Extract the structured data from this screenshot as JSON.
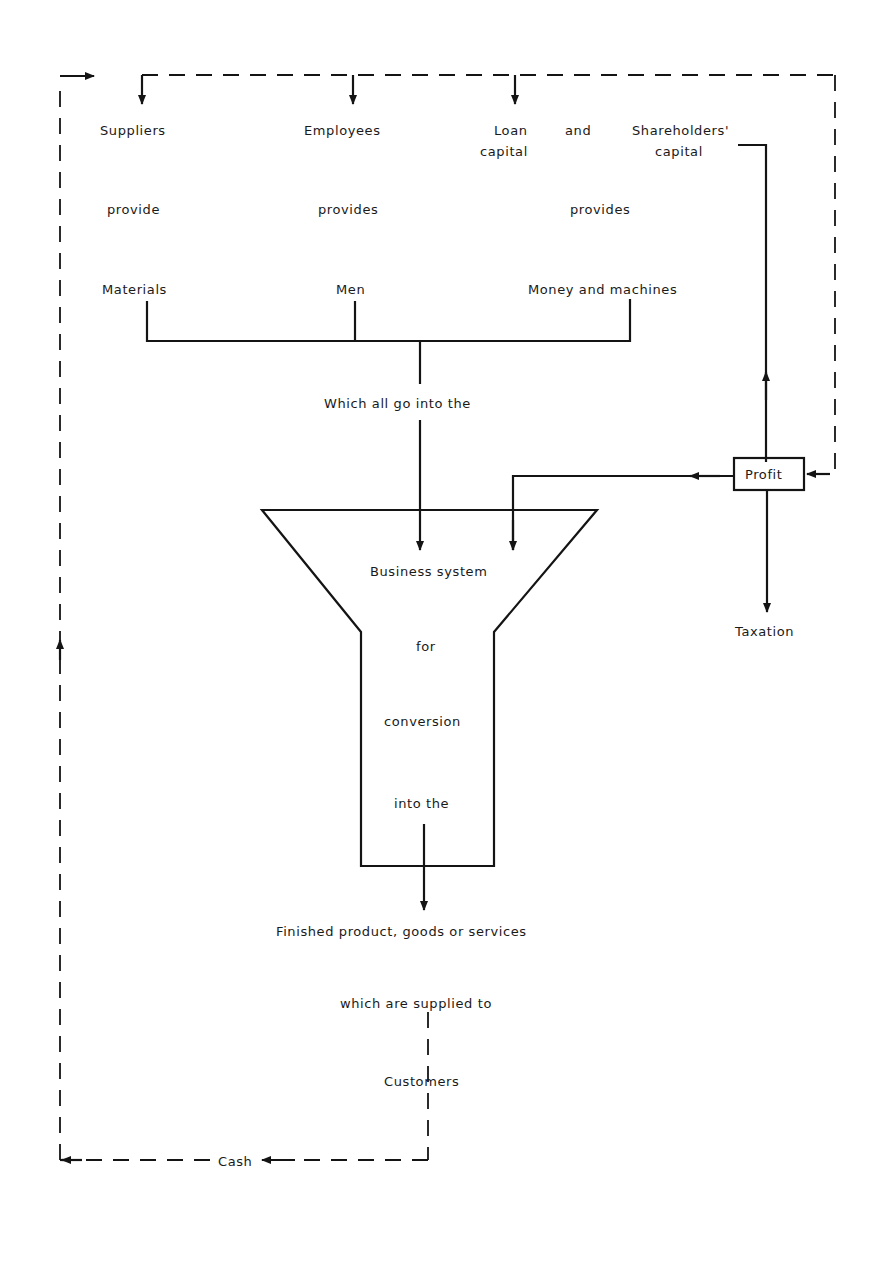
{
  "diagram": {
    "sources": [
      {
        "name": "Suppliers",
        "verb": "provide",
        "resource": "Materials"
      },
      {
        "name": "Employees",
        "verb": "provides",
        "resource": "Men"
      },
      {
        "name_line1": "Loan",
        "connector": "and",
        "name_line2": "capital",
        "verb": "provides",
        "resource": "Money and machines"
      }
    ],
    "shareholders": {
      "line1": "Shareholders'",
      "line2": "capital"
    },
    "merge_label": "Which all go into the",
    "funnel": {
      "line1": "Business system",
      "line2": "for",
      "line3": "conversion",
      "line4": "into the"
    },
    "output": "Finished product, goods or services",
    "supplied_to": "which are supplied to",
    "customers": "Customers",
    "cash": "Cash",
    "profit": "Profit",
    "taxation": "Taxation"
  }
}
